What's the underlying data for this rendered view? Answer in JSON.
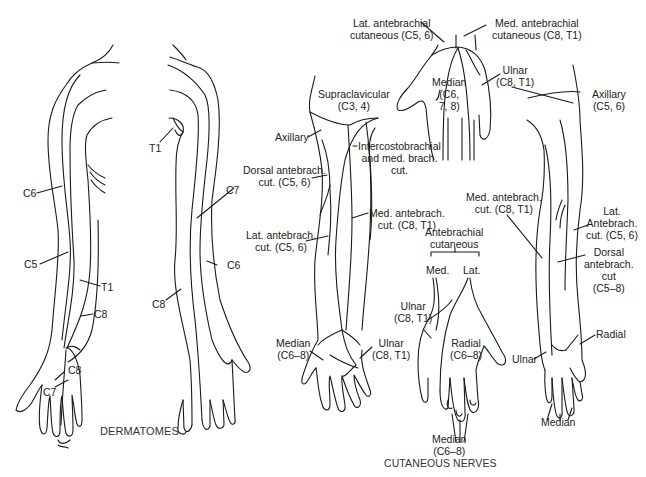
{
  "figure": {
    "dermatomes_title": "DERMATOMES",
    "cutaneous_title": "CUTANEOUS NERVES"
  },
  "dermatomes": {
    "front_arm": {
      "c6": "C6",
      "c5": "C5",
      "t1": "T1",
      "c8_forearm": "C8",
      "c8_hand": "C8",
      "c7_hand": "C7"
    },
    "back_arm": {
      "t1": "T1",
      "c7": "C7",
      "c6": "C6",
      "c8": "C8"
    }
  },
  "cutaneous": {
    "posterior_arm": {
      "supraclavicular": [
        "Supraclavicular",
        "(C3, 4)"
      ],
      "axillary": "Axillary",
      "dorsal_antebrach": [
        "Dorsal antebrach.",
        "cut. (C5, 6)"
      ],
      "lat_antebrach": [
        "Lat. antebrach.",
        "cut. (C5, 6)"
      ],
      "intercostobrachial": [
        "Intercostobrachial",
        "and med. brach.",
        "cut."
      ],
      "med_antebrach": [
        "Med. antebrach.",
        "cut. (C8, T1)"
      ],
      "median": [
        "Median",
        "(C6–8)"
      ],
      "ulnar": [
        "Ulnar",
        "(C8, T1)"
      ]
    },
    "palm_top": {
      "lat_antebrachial": [
        "Lat. antebrachial",
        "cutaneous (C5, 6)"
      ],
      "med_antebrachial": [
        "Med. antebrachial",
        "cutaneous (C8, T1)"
      ],
      "median": [
        "Median",
        "(C6,",
        "7, 8)"
      ],
      "ulnar": [
        "Ulnar",
        "(C8, T1)"
      ]
    },
    "dorsal_hand": {
      "antebrachial": [
        "Antebrachial",
        "cutaneous"
      ],
      "med": "Med.",
      "lat": "Lat.",
      "ulnar": [
        "Ulnar",
        "(C8, T1)"
      ],
      "radial": [
        "Radial",
        "(C6–8)"
      ],
      "median": [
        "Median",
        "(C6–8)"
      ]
    },
    "anterior_arm": {
      "axillary": [
        "Axillary",
        "(C5, 6)"
      ],
      "med_antebrach": [
        "Med. antebrach.",
        "cut. (C8, T1)"
      ],
      "lat_antebrach": [
        "Lat.",
        "Antebrach.",
        "cut. (C5, 6)"
      ],
      "dorsal_antebrach": [
        "Dorsal",
        "antebrach.",
        "cut",
        "(C5–8)"
      ],
      "radial": "Radial",
      "ulnar": "Ulnar",
      "median": "Median"
    }
  }
}
